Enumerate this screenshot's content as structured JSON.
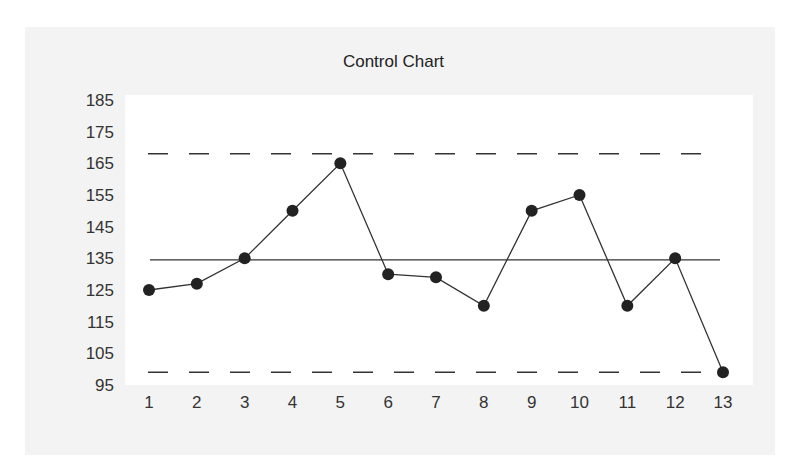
{
  "chart_data": {
    "type": "line",
    "title": "Control Chart",
    "xlabel": "",
    "ylabel": "",
    "categories": [
      "1",
      "2",
      "3",
      "4",
      "5",
      "6",
      "7",
      "8",
      "9",
      "10",
      "11",
      "12",
      "13"
    ],
    "series": [
      {
        "name": "Observations",
        "values": [
          125,
          127,
          135,
          150,
          165,
          130,
          129,
          120,
          150,
          155,
          120,
          135,
          99
        ],
        "color": "#222222",
        "marker": "circle"
      }
    ],
    "center_line": 134.5,
    "upper_control_limit": 168,
    "lower_control_limit": 99,
    "yticks": [
      185,
      175,
      165,
      155,
      145,
      135,
      125,
      115,
      105,
      95
    ],
    "ylim": [
      95,
      185
    ],
    "grid": false,
    "legend": "none"
  },
  "colors": {
    "panel_bg": "#f3f3f3",
    "plot_bg": "#ffffff",
    "line": "#333333",
    "marker": "#222222"
  }
}
